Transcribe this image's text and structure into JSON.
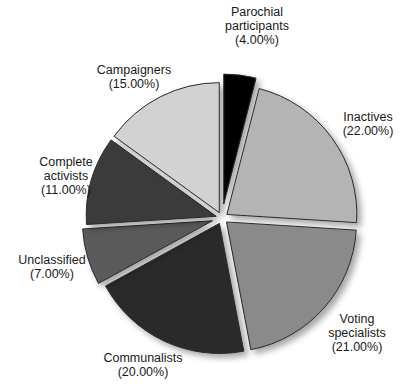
{
  "chart_data": {
    "type": "pie",
    "title": "",
    "start_angle_deg": 0,
    "direction": "clockwise",
    "center": [
      222,
      218
    ],
    "radius": 130,
    "slices": [
      {
        "name": "Parochial participants",
        "value": 4.0,
        "pct_label": "(4.00%)",
        "color": "#050505",
        "explode": 14,
        "label_lines": [
          "Parochial",
          "participants"
        ],
        "label_pos": [
          257,
          5
        ]
      },
      {
        "name": "Inactives",
        "value": 22.0,
        "pct_label": "(22.00%)",
        "color": "#b4b4b4",
        "explode": 6,
        "label_lines": [
          "Inactives"
        ],
        "label_pos": [
          368,
          110
        ]
      },
      {
        "name": "Voting specialists",
        "value": 21.0,
        "pct_label": "(21.00%)",
        "color": "#8a8a8a",
        "explode": 6,
        "label_lines": [
          "Voting",
          "specialists"
        ],
        "label_pos": [
          357,
          312
        ]
      },
      {
        "name": "Communalists",
        "value": 20.0,
        "pct_label": "(20.00%)",
        "color": "#2c2c2c",
        "explode": 6,
        "label_lines": [
          "Communalists"
        ],
        "label_pos": [
          143,
          351
        ]
      },
      {
        "name": "Unclassified",
        "value": 7.0,
        "pct_label": "(7.00%)",
        "color": "#5a5a5a",
        "explode": 10,
        "label_lines": [
          "Unclassified"
        ],
        "label_pos": [
          52,
          253
        ]
      },
      {
        "name": "Complete activists",
        "value": 11.0,
        "pct_label": "(11.00%)",
        "color": "#3a3a3a",
        "explode": 6,
        "label_lines": [
          "Complete",
          "activists"
        ],
        "label_pos": [
          66,
          155
        ]
      },
      {
        "name": "Campaigners",
        "value": 15.0,
        "pct_label": "(15.00%)",
        "color": "#d2d2d2",
        "explode": 6,
        "label_lines": [
          "Campaigners"
        ],
        "label_pos": [
          134,
          63
        ]
      }
    ]
  }
}
